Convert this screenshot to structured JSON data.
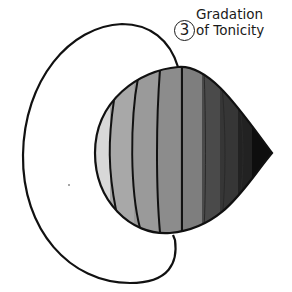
{
  "annotation": {
    "number": "3",
    "title_line1": "Gradation",
    "title_line2": "of Tonicity"
  },
  "bands": [
    {
      "index": 1,
      "tone": "#d8d8d8"
    },
    {
      "index": 2,
      "tone": "#a8a8a8"
    },
    {
      "index": 3,
      "tone": "#9a9a9a"
    },
    {
      "index": 4,
      "tone": "#8c8c8c"
    },
    {
      "index": 5,
      "tone": "#7e7e7e"
    },
    {
      "index": 6,
      "tone": "#4a4a4a"
    },
    {
      "index": 7,
      "tone": "#363636"
    },
    {
      "index": 8,
      "tone": "#222222"
    },
    {
      "index": 9,
      "tone": "#0e0e0e"
    }
  ],
  "colors": {
    "outline": "#111111",
    "background": "#ffffff"
  }
}
